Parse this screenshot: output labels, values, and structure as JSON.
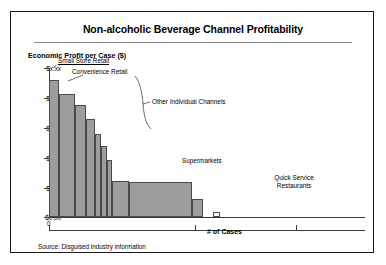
{
  "frame": {
    "title": "Non-alcoholic Beverage Channel Profitability",
    "source_note": "Source: Disguised industry information",
    "border_color": "#1a1a1a",
    "background": "#ffffff"
  },
  "chart_data": {
    "type": "bar",
    "title": "Non-alcoholic Beverage Channel Profitability",
    "subtitle": "",
    "xlabel": "# of Cases",
    "ylabel": "Economic Profit per Case ($)",
    "grid": false,
    "legend_position": "none",
    "note": "Profit-pool / value-curve chart: bar width = number of cases sold through the channel, bar height = economic profit per case. Dollar values on the y-axis are deliberately disguised as $x.xx.",
    "ylim": [
      0,
      6
    ],
    "ytick_labels": [
      "$x.xx",
      "$x.xx",
      "$x.xx",
      "$x.xx",
      "$x.xx",
      "$0.00"
    ],
    "ytick_values": [
      5.5,
      4.4,
      3.3,
      2.2,
      1.1,
      0
    ],
    "xtick_labels": [
      "0",
      "",
      ""
    ],
    "xtick_values": [
      0,
      46,
      78
    ],
    "xlim": [
      0,
      100
    ],
    "categories": [
      "Small Store Retail",
      "Convenience Retail",
      "Other Individual Channel 1",
      "Other Individual Channel 2",
      "Other Individual Channel 3",
      "Other Individual Channel 4",
      "Other Individual Channel 5",
      "Other Individual Channel 6",
      "Supermarkets",
      "Other Individual Channel 7",
      "Quick Service Restaurants"
    ],
    "values": [
      5.5,
      4.95,
      4.5,
      3.95,
      3.35,
      2.85,
      2.3,
      1.45,
      1.42,
      0.72,
      0.2
    ],
    "widths": [
      3.3,
      4.9,
      3.4,
      3.1,
      1.7,
      2.0,
      1.5,
      5.3,
      19.9,
      3.6,
      2.2
    ],
    "bar_fill": "#9d9d9d",
    "bar_edge": "#4a4a4a",
    "hollow_bars": [
      "Quick Service Restaurants"
    ],
    "gap_after": "Other Individual Channel 7"
  },
  "annotations": [
    {
      "name": "small-store-retail",
      "text": "Small Store Retail",
      "underline": true
    },
    {
      "name": "convenience-retail",
      "text": "Convenience Retail",
      "underline": false
    },
    {
      "name": "other-individual-channels",
      "text": "Other Individual Channels",
      "underline": false
    },
    {
      "name": "supermarkets",
      "text": "Supermarkets",
      "underline": false
    },
    {
      "name": "quick-service-restaurants-line1",
      "text": "Quick Service",
      "underline": false
    },
    {
      "name": "quick-service-restaurants-line2",
      "text": "Restaurants",
      "underline": false
    }
  ],
  "axis": {
    "y_title": "Economic Profit per Case ($)",
    "x_title": "# of Cases",
    "x_origin_label": "0",
    "axis_color": "#3a3a3a"
  }
}
